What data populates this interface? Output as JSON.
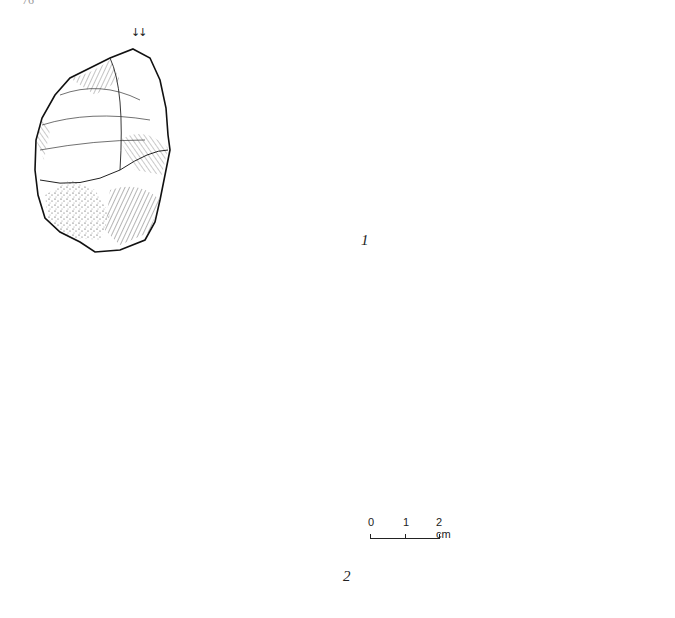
{
  "page": {
    "page_number": "76",
    "running_header": "",
    "background": "#ffffff",
    "ink_color": "#1a1a1a"
  },
  "figures": [
    {
      "id": "1",
      "label": "1",
      "views": [
        "dorsal-face",
        "cross-section",
        "side-profile",
        "ventral-face"
      ],
      "annotation": "↓↓"
    },
    {
      "id": "2",
      "label": "2",
      "views": [
        "dorsal-face",
        "side-profile",
        "cross-section",
        "ventral-face"
      ]
    }
  ],
  "scale_bar": {
    "ticks": [
      "0",
      "1",
      "2 cm"
    ],
    "unit": "cm"
  }
}
